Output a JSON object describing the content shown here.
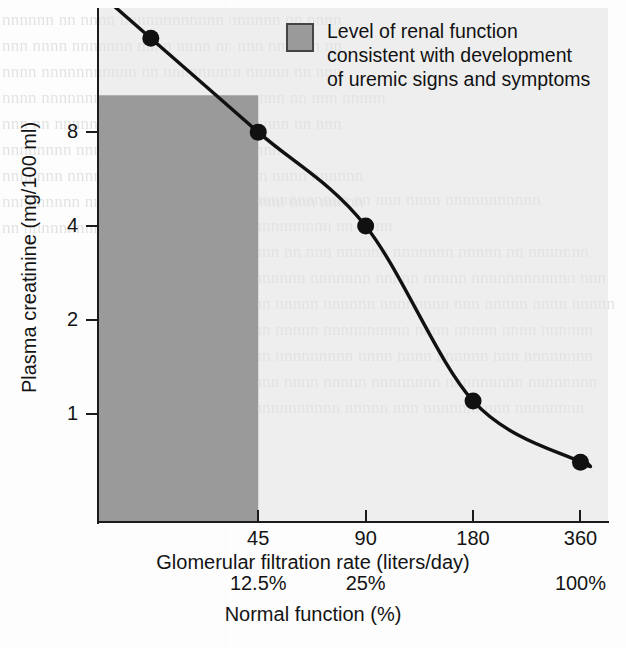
{
  "figure": {
    "name": "plasma-creatinine-vs-gfr",
    "legend": {
      "swatch_color": "#9a9a9a",
      "lines": [
        "Level of renal function",
        "consistent with development",
        "of uremic signs and symptoms"
      ]
    }
  },
  "chart_data": {
    "type": "line",
    "title": "",
    "subtitle": "",
    "xlabel": "Glomerular filtration rate (liters/day)",
    "ylabel": "Plasma creatinine (mg/100 ml)",
    "secondary_xlabel": "Normal function (%)",
    "grid": false,
    "legend_position": "top-center",
    "x_scale": "log2",
    "y_scale": "log-like",
    "xlim": [
      16,
      430
    ],
    "ylim": [
      0.45,
      20
    ],
    "x_ticks": [
      45,
      90,
      180,
      360
    ],
    "x_tick_labels": [
      "45",
      "90",
      "180",
      "360"
    ],
    "y_ticks": [
      8,
      4,
      2,
      1
    ],
    "y_tick_labels": [
      "8",
      "4",
      "2",
      "1"
    ],
    "secondary_x_ticks": [
      45,
      90,
      360
    ],
    "secondary_x_tick_labels": [
      "12.5%",
      "25%",
      "100%"
    ],
    "series": [
      {
        "name": "Plasma creatinine",
        "marker": "filled-circle",
        "marker_color": "#111111",
        "line_color": "#111111",
        "x": [
          22.5,
          45,
          90,
          180,
          360
        ],
        "values": [
          16.0,
          8.0,
          4.0,
          1.1,
          0.7
        ]
      }
    ],
    "shaded_region": {
      "label": "Level of renal function consistent with development of uremic signs and symptoms",
      "color": "#9a9a9a",
      "x_range": [
        16,
        45
      ],
      "y_range": [
        0.45,
        10.5
      ]
    },
    "annotations": []
  },
  "background_text": {
    "left_column": [
      "nnnnnn nn nnnn nnnnnnnnnnnn nnnnnn nn nnnn",
      "nnn nnnn nnnnnnn nnnn nnnn nn nnn nnnnnn nn",
      "nnnn nnnnnnnnnnn nn nnnnnnnnn nnnnn nn nnn",
      "nnnn nnnnnnnnnn nn nnnnn nn nnnnnnn nn nnn nnnnn",
      "nnn nn nnnnnnnn nnnnnnnnnnnn nnnnnn nn nnn",
      "nnnnnnnn nnn nn nnnnnnnnn nnnnnnnn",
      "nnnnnnn nnnnnnnnnn nnnnnnnn nnnn nnnn nnnnnn",
      "nnnnnnnnn nnn nn nnnnnn nnnnnn nnnn nnn nnnnn",
      "nn nnnnnnnnnn"
    ],
    "right_column": [
      "nnnnnnnnnnnnn nn nnn nnnn nnnnnnnnnnn",
      "nnnnnnnnnnn nn nnnn",
      "nnnnn nn nnn nnnnnn nnnnnnn nnnnn nn nnnnnnn",
      "nnnnnnnn nnnnnnn nnnnn nnnnn nnnnnnnnnnnn nnn",
      "nnnn nnnnn nnnnnn nnnnnnnn nnn nnnnn nnnn nnnnn",
      "nnnn nnnnn nnnnnnnnnn nnnn nnnnn nnnn nnnnnn",
      "nnnn nnnnnnnnn nnnn nnnn nnnnnn nnn nnnnnnnn",
      "nnnnn nnnn nnnnn nnnnnnnn nnnnnnnnn nnnnnnnn",
      "nnnnnnnnnnnn nnnnn nnn nnnnnnnnnn nnnnnnnn"
    ]
  }
}
